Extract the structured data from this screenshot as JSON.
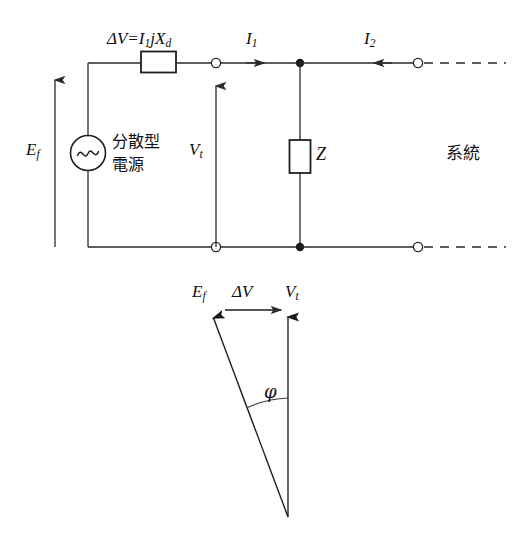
{
  "figure": {
    "type": "circuit-and-phasor-diagram",
    "stroke_color": "#2a2a2a",
    "text_color": "#101010",
    "background": "#ffffff"
  },
  "circuit": {
    "source_label": "分散型\n電源",
    "source_label_line1": "分散型",
    "source_label_line2": "電源",
    "emf_label": "E",
    "emf_sub": "f",
    "drop_label_prefix": "ΔV=I",
    "drop_label_sub1": "1",
    "drop_label_mid": "jX",
    "drop_label_sub2": "d",
    "terminal_voltage_label": "V",
    "terminal_voltage_sub": "t",
    "current1_label": "I",
    "current1_sub": "1",
    "current2_label": "I",
    "current2_sub": "2",
    "impedance_label": "Z",
    "grid_label": "系統"
  },
  "phasor": {
    "ef_label": "E",
    "ef_sub": "f",
    "dv_label": "ΔV",
    "vt_label": "V",
    "vt_sub": "t",
    "angle_label": "φ"
  }
}
